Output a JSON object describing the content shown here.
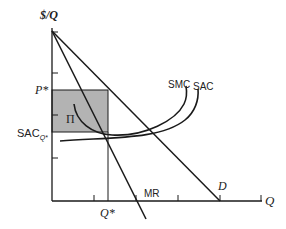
{
  "diagram": {
    "y_axis_label": "$/Q",
    "x_axis_label": "Q",
    "price_label": "P*",
    "cost_label_main": "SAC",
    "cost_label_sub": "Q*",
    "quantity_label": "Q*",
    "profit_label": "Π",
    "curves": {
      "smc": "SMC",
      "sac": "SAC",
      "mr": "MR",
      "demand": "D"
    },
    "colors": {
      "line": "#1a1a1a",
      "profit_fill": "#b3b3b3",
      "background": "#ffffff"
    }
  }
}
